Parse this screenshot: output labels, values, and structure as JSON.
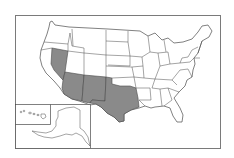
{
  "map": {
    "title": "",
    "type": "choropleth-outline",
    "region": "United States",
    "colors": {
      "background": "#ffffff",
      "frame": "#7a7a7a",
      "state_fill": "#ffffff",
      "state_stroke": "#4a4a4a",
      "highlight_fill": "#8a8a8a"
    },
    "highlighted_states": [
      "Nevada",
      "Arizona",
      "New Mexico",
      "Texas"
    ],
    "insets": [
      {
        "name": "Hawaii"
      },
      {
        "name": "Alaska"
      }
    ],
    "labels": []
  }
}
